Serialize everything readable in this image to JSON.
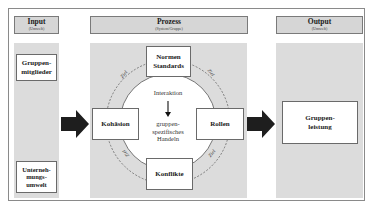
{
  "columns": {
    "input": {
      "title": "Input",
      "subtitle": "(Umwelt)"
    },
    "process": {
      "title": "Prozess",
      "subtitle": "(System/Gruppe)"
    },
    "output": {
      "title": "Output",
      "subtitle": "(Umwelt)"
    }
  },
  "input_boxes": [
    {
      "label": "Gruppen-\nmitglieder"
    },
    {
      "label": "Unterneh-\nmungs-\numwelt"
    }
  ],
  "process_boxes": {
    "top": "Normen\nStandards",
    "left": "Kohäsion",
    "right": "Rollen",
    "bottom": "Konflikte"
  },
  "center": {
    "top_text": "Interaktion",
    "bottom_text": "gruppen-\nspezifisches\nHandeln"
  },
  "ring_labels": [
    "Ziel",
    "Ziel",
    "Ziel",
    "Ziel"
  ],
  "output_boxes": [
    {
      "label": "Gruppen-\nleistung"
    }
  ],
  "colors": {
    "column_fill": "#dcdcdc",
    "header_fill": "#d6d6d6",
    "arrow": "#1e1e1e",
    "border": "#6a6a6a"
  }
}
